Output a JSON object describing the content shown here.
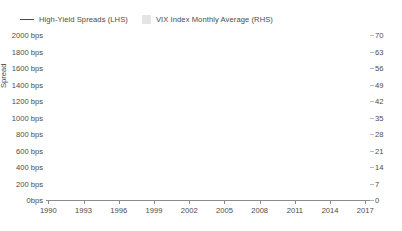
{
  "legend": {
    "items": [
      {
        "name": "high-yield-spreads",
        "label": "High-Yield Spreads (LHS)",
        "marker": "line",
        "color": "#4a4a4a"
      },
      {
        "name": "vix-index",
        "label": "VIX Index Monthly Average (RHS)",
        "marker": "area-swatch",
        "color": "#e4e4e4"
      }
    ]
  },
  "chart_data": {
    "type": "line",
    "title": "",
    "xlabel": "",
    "ylabel": "Spread",
    "y2label": "",
    "grid": true,
    "legend_position": "top-left",
    "xlim": [
      1989.8,
      2017.4
    ],
    "ylim": [
      0,
      2000
    ],
    "y2lim": [
      0,
      70
    ],
    "xticks": [
      "1990",
      "1993",
      "1996",
      "1999",
      "2002",
      "2005",
      "2008",
      "2011",
      "2014",
      "2017"
    ],
    "xtick_values": [
      1990,
      1993,
      1996,
      1999,
      2002,
      2005,
      2008,
      2011,
      2014,
      2017
    ],
    "yticks": [
      "0bps",
      "200 bps",
      "400 bps",
      "600 bps",
      "800 bps",
      "1000 bps",
      "1200 bps",
      "1400 bps",
      "1600 bps",
      "1800 bps",
      "2000 bps"
    ],
    "ytick_values": [
      0,
      200,
      400,
      600,
      800,
      1000,
      1200,
      1400,
      1600,
      1800,
      2000
    ],
    "y2ticks": [
      "0",
      "7",
      "14",
      "21",
      "28",
      "35",
      "42",
      "49",
      "56",
      "63",
      "70"
    ],
    "y2tick_values": [
      0,
      7,
      14,
      21,
      28,
      35,
      42,
      49,
      56,
      63,
      70
    ],
    "series": [
      {
        "name": "High-Yield Spreads (LHS)",
        "axis": "left",
        "units": "bps",
        "type": "line",
        "color": "#4a4a4a",
        "x": [
          1990.0,
          1990.25,
          1990.5,
          1990.75,
          1991.0,
          1991.25,
          1991.5,
          1991.75,
          1992.0,
          1992.25,
          1992.5,
          1992.75,
          1993.0,
          1993.25,
          1993.5,
          1993.75,
          1994.0,
          1994.25,
          1994.5,
          1994.75,
          1995.0,
          1995.25,
          1995.5,
          1995.75,
          1996.0,
          1996.25,
          1996.5,
          1996.75,
          1997.0,
          1997.25,
          1997.5,
          1997.75,
          1998.0,
          1998.25,
          1998.5,
          1998.75,
          1999.0,
          1999.25,
          1999.5,
          1999.75,
          2000.0,
          2000.25,
          2000.5,
          2000.75,
          2001.0,
          2001.25,
          2001.5,
          2001.75,
          2002.0,
          2002.25,
          2002.5,
          2002.75,
          2003.0,
          2003.25,
          2003.5,
          2003.75,
          2004.0,
          2004.25,
          2004.5,
          2004.75,
          2005.0,
          2005.25,
          2005.5,
          2005.75,
          2006.0,
          2006.25,
          2006.5,
          2006.75,
          2007.0,
          2007.25,
          2007.5,
          2007.75,
          2008.0,
          2008.25,
          2008.5,
          2008.75,
          2009.0,
          2009.25,
          2009.5,
          2009.75,
          2010.0,
          2010.25,
          2010.5,
          2010.75,
          2011.0,
          2011.25,
          2011.5,
          2011.75,
          2012.0,
          2012.25,
          2012.5,
          2012.75,
          2013.0,
          2013.25,
          2013.5,
          2013.75,
          2014.0,
          2014.25,
          2014.5,
          2014.75,
          2015.0,
          2015.25,
          2015.5,
          2015.75,
          2016.0,
          2016.25,
          2016.5,
          2016.75,
          2017.0,
          2017.2
        ],
        "values": [
          760,
          800,
          880,
          1150,
          1080,
          880,
          730,
          700,
          660,
          620,
          600,
          580,
          560,
          540,
          520,
          505,
          490,
          470,
          455,
          460,
          480,
          470,
          455,
          450,
          440,
          430,
          420,
          410,
          395,
          380,
          370,
          360,
          370,
          400,
          520,
          620,
          560,
          540,
          560,
          590,
          630,
          680,
          760,
          860,
          900,
          870,
          960,
          1080,
          950,
          1020,
          1100,
          1040,
          880,
          700,
          620,
          570,
          520,
          460,
          420,
          400,
          380,
          360,
          380,
          360,
          340,
          330,
          320,
          320,
          330,
          360,
          480,
          620,
          680,
          720,
          900,
          1730,
          1500,
          1250,
          900,
          800,
          700,
          640,
          600,
          580,
          620,
          780,
          720,
          660,
          700,
          640,
          600,
          620,
          580,
          540,
          500,
          470,
          450,
          440,
          430,
          450,
          520,
          620,
          700,
          800,
          740,
          620,
          540,
          480,
          420,
          400
        ]
      },
      {
        "name": "VIX Index Monthly Average (RHS)",
        "axis": "right",
        "units": "index",
        "type": "area",
        "color": "#e6e6e6",
        "x": [
          1990.0,
          1990.25,
          1990.5,
          1990.75,
          1991.0,
          1991.25,
          1991.5,
          1991.75,
          1992.0,
          1992.25,
          1992.5,
          1992.75,
          1993.0,
          1993.25,
          1993.5,
          1993.75,
          1994.0,
          1994.25,
          1994.5,
          1994.75,
          1995.0,
          1995.25,
          1995.5,
          1995.75,
          1996.0,
          1996.25,
          1996.5,
          1996.75,
          1997.0,
          1997.25,
          1997.5,
          1997.75,
          1998.0,
          1998.25,
          1998.5,
          1998.75,
          1999.0,
          1999.25,
          1999.5,
          1999.75,
          2000.0,
          2000.25,
          2000.5,
          2000.75,
          2001.0,
          2001.25,
          2001.5,
          2001.75,
          2002.0,
          2002.25,
          2002.5,
          2002.75,
          2003.0,
          2003.25,
          2003.5,
          2003.75,
          2004.0,
          2004.25,
          2004.5,
          2004.75,
          2005.0,
          2005.25,
          2005.5,
          2005.75,
          2006.0,
          2006.25,
          2006.5,
          2006.75,
          2007.0,
          2007.25,
          2007.5,
          2007.75,
          2008.0,
          2008.25,
          2008.5,
          2008.75,
          2009.0,
          2009.25,
          2009.5,
          2009.75,
          2010.0,
          2010.25,
          2010.5,
          2010.75,
          2011.0,
          2011.25,
          2011.5,
          2011.75,
          2012.0,
          2012.25,
          2012.5,
          2012.75,
          2013.0,
          2013.25,
          2013.5,
          2013.75,
          2014.0,
          2014.25,
          2014.5,
          2014.75,
          2015.0,
          2015.25,
          2015.5,
          2015.75,
          2016.0,
          2016.25,
          2016.5,
          2016.75,
          2017.0,
          2017.2
        ],
        "values": [
          22,
          19,
          24,
          27,
          22,
          18,
          17,
          17,
          16,
          14,
          13,
          13,
          13,
          12,
          12,
          12,
          13,
          14,
          14,
          14,
          13,
          12,
          12,
          12,
          14,
          15,
          16,
          18,
          21,
          22,
          24,
          25,
          21,
          21,
          33,
          27,
          25,
          24,
          23,
          23,
          24,
          26,
          21,
          25,
          26,
          25,
          31,
          34,
          24,
          22,
          35,
          34,
          32,
          24,
          20,
          17,
          17,
          15,
          15,
          13,
          12,
          12,
          13,
          12,
          12,
          15,
          13,
          11,
          11,
          14,
          21,
          22,
          25,
          21,
          32,
          58,
          45,
          36,
          27,
          23,
          20,
          25,
          24,
          21,
          20,
          33,
          36,
          28,
          21,
          18,
          16,
          17,
          14,
          14,
          14,
          14,
          14,
          14,
          14,
          16,
          17,
          14,
          20,
          18,
          20,
          24,
          16,
          14,
          12,
          11
        ]
      }
    ]
  },
  "axes": {
    "left_title": "Spread"
  }
}
